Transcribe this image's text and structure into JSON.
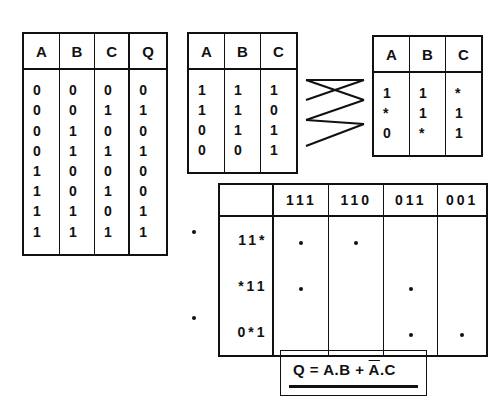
{
  "truth_table": {
    "headers": [
      "A",
      "B",
      "C",
      "Q"
    ],
    "rows": [
      [
        "0",
        "0",
        "0",
        "0"
      ],
      [
        "0",
        "0",
        "1",
        "1"
      ],
      [
        "0",
        "1",
        "0",
        "0"
      ],
      [
        "0",
        "1",
        "1",
        "1"
      ],
      [
        "1",
        "0",
        "0",
        "0"
      ],
      [
        "1",
        "0",
        "1",
        "0"
      ],
      [
        "1",
        "1",
        "0",
        "1"
      ],
      [
        "1",
        "1",
        "1",
        "1"
      ]
    ]
  },
  "minterm_table": {
    "headers": [
      "A",
      "B",
      "C"
    ],
    "rows": [
      [
        "1",
        "1",
        "1"
      ],
      [
        "1",
        "1",
        "0"
      ],
      [
        "0",
        "1",
        "1"
      ],
      [
        "0",
        "0",
        "1"
      ]
    ]
  },
  "implicant_table": {
    "headers": [
      "A",
      "B",
      "C"
    ],
    "rows": [
      [
        "1",
        "1",
        "*"
      ],
      [
        "*",
        "1",
        "1"
      ],
      [
        "0",
        "*",
        "1"
      ]
    ]
  },
  "prime_implicant_chart": {
    "corner": "",
    "columns": [
      "111",
      "110",
      "011",
      "001"
    ],
    "rows": [
      {
        "label": "11*",
        "essential": true,
        "covers": [
          true,
          true,
          false,
          false
        ]
      },
      {
        "label": "*11",
        "essential": false,
        "covers": [
          true,
          false,
          true,
          false
        ]
      },
      {
        "label": "0*1",
        "essential": true,
        "covers": [
          false,
          false,
          true,
          true
        ]
      }
    ]
  },
  "formula": {
    "lhs": "Q",
    "eq": " = ",
    "term1": "A.B",
    "plus": " + ",
    "term2_bar": "A",
    "term2_rest": ".C"
  }
}
